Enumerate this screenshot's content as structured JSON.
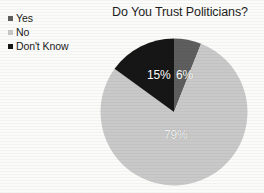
{
  "chart_data": {
    "type": "pie",
    "title": "Do You Trust Politicians?",
    "categories": [
      "Yes",
      "No",
      "Don't Know"
    ],
    "values": [
      6,
      79,
      15
    ],
    "value_labels": [
      "6%",
      "79%",
      "15%"
    ],
    "units": "percent",
    "start_angle_deg": 0,
    "direction": "clockwise",
    "legend_position": "top-left",
    "grid": false,
    "xlabel": "",
    "ylabel": "",
    "colors": {
      "yes": "#5e5e5e",
      "no": "#c9c9c9",
      "dont_know": "#161616",
      "background": "#fbfbfa",
      "title_text": "#1e1e1e",
      "label_text": "#ffffff"
    }
  },
  "legend": {
    "items": [
      {
        "label": "Yes",
        "color": "#5e5e5e"
      },
      {
        "label": "No",
        "color": "#c9c9c9"
      },
      {
        "label": "Don't Know",
        "color": "#161616"
      }
    ]
  },
  "labels": {
    "yes": "6%",
    "no": "79%",
    "dont_know": "15%"
  }
}
